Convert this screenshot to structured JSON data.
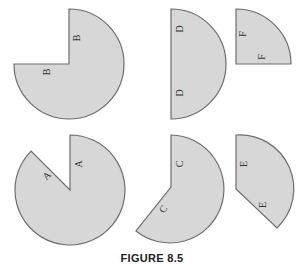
{
  "figure": {
    "caption": "FIGURE 8.5",
    "fill_color": "#d7d7d7",
    "stroke_color": "#6e6e6e",
    "shapes": [
      {
        "id": "B",
        "labels": [
          "B",
          "B"
        ],
        "description": "three-quarter circle with missing upper-left quadrant"
      },
      {
        "id": "D",
        "labels": [
          "D",
          "D"
        ],
        "description": "half circle, flat edge on left"
      },
      {
        "id": "F",
        "labels": [
          "F",
          "F"
        ],
        "description": "quarter circle"
      },
      {
        "id": "A",
        "labels": [
          "A",
          "A"
        ],
        "description": "circle with 45-degree wedge removed at upper-left"
      },
      {
        "id": "C",
        "labels": [
          "C",
          "C"
        ],
        "description": "circle with larger wedge removed on left side"
      },
      {
        "id": "E",
        "labels": [
          "E",
          "E"
        ],
        "description": "circular sector of about 135 degrees"
      }
    ]
  }
}
